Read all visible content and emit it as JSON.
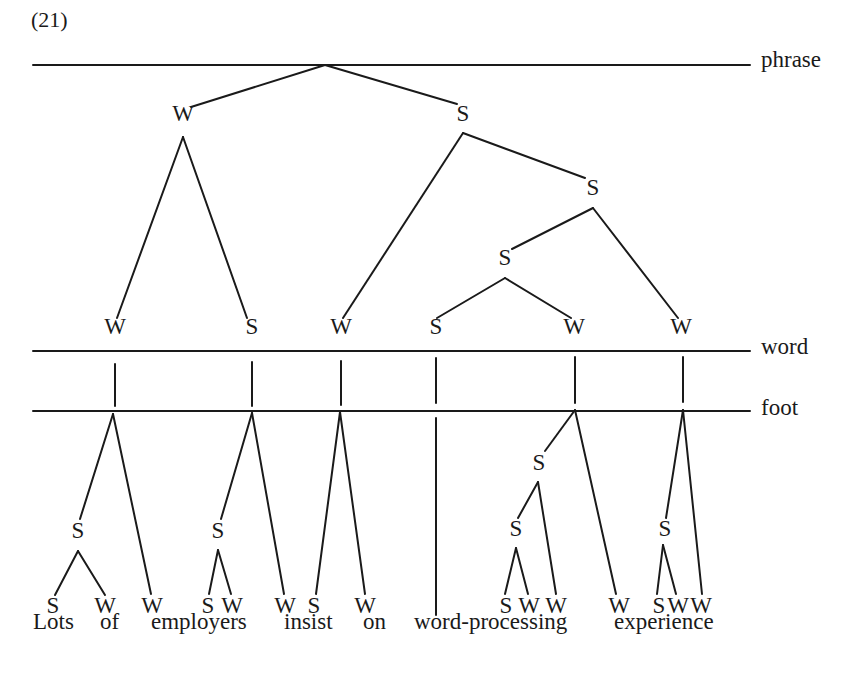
{
  "example_number": "(21)",
  "tiers": [
    {
      "id": "phrase",
      "label": "phrase",
      "y": 65,
      "x1": 33,
      "x2": 750
    },
    {
      "id": "word",
      "label": "word",
      "y": 351,
      "x1": 33,
      "x2": 750
    },
    {
      "id": "foot",
      "label": "foot",
      "y": 411,
      "x1": 33,
      "x2": 750
    }
  ],
  "sentence": {
    "text": "Lots of employers insist on word-processing experience",
    "words": [
      {
        "text": "Lots",
        "x": 33
      },
      {
        "text": "of",
        "x": 100
      },
      {
        "text": "employers",
        "x": 151
      },
      {
        "text": "insist",
        "x": 284
      },
      {
        "text": "on",
        "x": 363
      },
      {
        "text": "word-processing",
        "x": 414
      },
      {
        "text": "experience",
        "x": 614
      }
    ],
    "y": 624
  },
  "nodes": [
    {
      "id": "p_W",
      "label": "W",
      "x": 183,
      "y": 118
    },
    {
      "id": "p_S",
      "label": "S",
      "x": 463,
      "y": 118
    },
    {
      "id": "p_SS",
      "label": "S",
      "x": 593,
      "y": 192
    },
    {
      "id": "p_SSS",
      "label": "S",
      "x": 505,
      "y": 262
    },
    {
      "id": "w1",
      "label": "W",
      "x": 115,
      "y": 331
    },
    {
      "id": "w2",
      "label": "S",
      "x": 252,
      "y": 331
    },
    {
      "id": "w3",
      "label": "W",
      "x": 341,
      "y": 331
    },
    {
      "id": "w4",
      "label": "S",
      "x": 436,
      "y": 331
    },
    {
      "id": "w5",
      "label": "W",
      "x": 574,
      "y": 331
    },
    {
      "id": "w6",
      "label": "W",
      "x": 681,
      "y": 331
    },
    {
      "id": "f1_S",
      "label": "S",
      "x": 78,
      "y": 535
    },
    {
      "id": "f2_S",
      "label": "S",
      "x": 218,
      "y": 535
    },
    {
      "id": "f5_S",
      "label": "S",
      "x": 539,
      "y": 467
    },
    {
      "id": "f5_SS",
      "label": "S",
      "x": 516,
      "y": 533
    },
    {
      "id": "f6_S",
      "label": "S",
      "x": 665,
      "y": 533
    },
    {
      "id": "l1",
      "label": "S",
      "x": 53,
      "y": 610
    },
    {
      "id": "l2",
      "label": "W",
      "x": 105,
      "y": 610
    },
    {
      "id": "l3",
      "label": "W",
      "x": 152,
      "y": 610
    },
    {
      "id": "l4",
      "label": "S",
      "x": 208,
      "y": 610
    },
    {
      "id": "l5",
      "label": "W",
      "x": 232,
      "y": 610
    },
    {
      "id": "l6",
      "label": "W",
      "x": 285,
      "y": 610
    },
    {
      "id": "l7",
      "label": "S",
      "x": 314,
      "y": 610
    },
    {
      "id": "l8",
      "label": "W",
      "x": 365,
      "y": 610
    },
    {
      "id": "l9",
      "label": "S",
      "x": 506,
      "y": 610
    },
    {
      "id": "l10",
      "label": "W",
      "x": 529,
      "y": 610
    },
    {
      "id": "l11",
      "label": "W",
      "x": 556,
      "y": 610
    },
    {
      "id": "l12",
      "label": "W",
      "x": 619,
      "y": 610
    },
    {
      "id": "l13",
      "label": "S",
      "x": 659,
      "y": 610
    },
    {
      "id": "l14",
      "label": "W",
      "x": 678,
      "y": 610
    },
    {
      "id": "l15",
      "label": "W",
      "x": 701,
      "y": 610
    }
  ],
  "edges": [
    [
      325,
      65,
      191,
      107
    ],
    [
      325,
      65,
      457,
      104
    ],
    [
      183,
      137,
      117,
      318
    ],
    [
      183,
      137,
      247,
      318
    ],
    [
      463,
      133,
      343,
      318
    ],
    [
      463,
      133,
      585,
      178
    ],
    [
      593,
      208,
      512,
      249
    ],
    [
      593,
      208,
      678,
      318
    ],
    [
      505,
      278,
      437,
      318
    ],
    [
      505,
      278,
      571,
      318
    ],
    [
      115,
      364,
      115,
      406
    ],
    [
      252,
      362,
      252,
      406
    ],
    [
      341,
      361,
      341,
      405
    ],
    [
      436,
      358,
      436,
      403
    ],
    [
      575,
      357,
      575,
      403
    ],
    [
      683,
      357,
      683,
      402
    ],
    [
      113,
      414,
      80,
      519
    ],
    [
      113,
      414,
      151,
      594
    ],
    [
      78,
      551,
      55,
      595
    ],
    [
      78,
      551,
      105,
      595
    ],
    [
      252,
      413,
      221,
      519
    ],
    [
      252,
      413,
      284,
      594
    ],
    [
      218,
      550,
      209,
      594
    ],
    [
      218,
      550,
      231,
      594
    ],
    [
      340,
      412,
      316,
      594
    ],
    [
      340,
      412,
      365,
      594
    ],
    [
      436,
      418,
      436,
      615
    ],
    [
      575,
      410,
      545,
      451
    ],
    [
      575,
      410,
      616,
      594
    ],
    [
      538,
      482,
      518,
      518
    ],
    [
      538,
      482,
      556,
      594
    ],
    [
      516,
      548,
      505,
      594
    ],
    [
      516,
      548,
      528,
      594
    ],
    [
      683,
      410,
      666,
      518
    ],
    [
      683,
      410,
      702,
      594
    ],
    [
      663,
      545,
      657,
      594
    ],
    [
      663,
      545,
      676,
      594
    ]
  ]
}
